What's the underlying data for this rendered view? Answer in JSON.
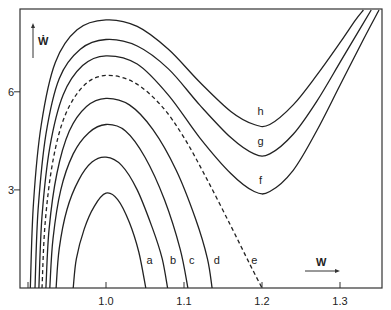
{
  "chart_data": {
    "type": "line",
    "title": "",
    "xlabel": "W",
    "ylabel": "Ẇ",
    "xlim": [
      0.885,
      1.355
    ],
    "ylim": [
      0,
      8.5
    ],
    "grid": false,
    "legend": "none (curves labeled inline a–h)",
    "x_ticks": [
      0.9,
      1.0,
      1.1,
      1.2,
      1.3
    ],
    "x_tick_labels": [
      "",
      "1.0",
      "1.1",
      "1.2",
      "1.3"
    ],
    "y_ticks": [
      3,
      6
    ],
    "y_tick_labels": [
      "3",
      "6"
    ],
    "series": [
      {
        "name": "a",
        "style": "solid",
        "label_pos": [
          1.056,
          0.85
        ],
        "points": [
          [
            0.958,
            0
          ],
          [
            0.962,
            0.9
          ],
          [
            0.972,
            1.8
          ],
          [
            0.985,
            2.5
          ],
          [
            1.0,
            2.9
          ],
          [
            1.015,
            2.7
          ],
          [
            1.03,
            2.0
          ],
          [
            1.042,
            1.1
          ],
          [
            1.051,
            0
          ]
        ]
      },
      {
        "name": "b",
        "style": "solid",
        "label_pos": [
          1.086,
          0.85
        ],
        "points": [
          [
            0.936,
            0
          ],
          [
            0.94,
            1.2
          ],
          [
            0.95,
            2.4
          ],
          [
            0.965,
            3.3
          ],
          [
            0.982,
            3.85
          ],
          [
            1.0,
            4.0
          ],
          [
            1.02,
            3.75
          ],
          [
            1.04,
            3.0
          ],
          [
            1.06,
            1.8
          ],
          [
            1.072,
            0.9
          ],
          [
            1.079,
            0
          ]
        ]
      },
      {
        "name": "c",
        "style": "solid",
        "label_pos": [
          1.11,
          0.85
        ],
        "points": [
          [
            0.928,
            0
          ],
          [
            0.932,
            1.5
          ],
          [
            0.942,
            3.0
          ],
          [
            0.958,
            4.1
          ],
          [
            0.978,
            4.75
          ],
          [
            1.0,
            5.0
          ],
          [
            1.025,
            4.8
          ],
          [
            1.05,
            4.0
          ],
          [
            1.075,
            2.7
          ],
          [
            1.095,
            1.2
          ],
          [
            1.105,
            0
          ]
        ]
      },
      {
        "name": "d",
        "style": "solid",
        "label_pos": [
          1.142,
          0.85
        ],
        "points": [
          [
            0.923,
            0
          ],
          [
            0.927,
            1.8
          ],
          [
            0.937,
            3.5
          ],
          [
            0.953,
            4.8
          ],
          [
            0.975,
            5.55
          ],
          [
            1.0,
            5.8
          ],
          [
            1.03,
            5.6
          ],
          [
            1.06,
            4.85
          ],
          [
            1.09,
            3.6
          ],
          [
            1.115,
            2.1
          ],
          [
            1.13,
            0.9
          ],
          [
            1.136,
            0
          ]
        ]
      },
      {
        "name": "e",
        "style": "dashed",
        "label_pos": [
          1.19,
          0.85
        ],
        "points": [
          [
            0.918,
            0
          ],
          [
            0.922,
            2.0
          ],
          [
            0.932,
            3.9
          ],
          [
            0.948,
            5.3
          ],
          [
            0.972,
            6.2
          ],
          [
            1.0,
            6.5
          ],
          [
            1.035,
            6.3
          ],
          [
            1.07,
            5.6
          ],
          [
            1.1,
            4.6
          ],
          [
            1.13,
            3.3
          ],
          [
            1.16,
            1.9
          ],
          [
            1.185,
            0.7
          ],
          [
            1.2,
            0
          ]
        ]
      },
      {
        "name": "f",
        "style": "solid",
        "label_pos": [
          1.198,
          3.3
        ],
        "points": [
          [
            0.914,
            0
          ],
          [
            0.918,
            2.2
          ],
          [
            0.928,
            4.3
          ],
          [
            0.945,
            5.9
          ],
          [
            0.97,
            6.8
          ],
          [
            1.0,
            7.1
          ],
          [
            1.04,
            6.85
          ],
          [
            1.08,
            5.9
          ],
          [
            1.12,
            4.6
          ],
          [
            1.16,
            3.5
          ],
          [
            1.19,
            2.95
          ],
          [
            1.21,
            2.95
          ],
          [
            1.24,
            3.6
          ],
          [
            1.27,
            4.8
          ],
          [
            1.3,
            6.2
          ],
          [
            1.33,
            7.6
          ],
          [
            1.35,
            8.5
          ]
        ]
      },
      {
        "name": "g",
        "style": "solid",
        "label_pos": [
          1.198,
          4.5
        ],
        "points": [
          [
            0.909,
            0
          ],
          [
            0.913,
            2.4
          ],
          [
            0.923,
            4.7
          ],
          [
            0.94,
            6.4
          ],
          [
            0.967,
            7.3
          ],
          [
            1.0,
            7.6
          ],
          [
            1.04,
            7.4
          ],
          [
            1.08,
            6.7
          ],
          [
            1.12,
            5.6
          ],
          [
            1.16,
            4.6
          ],
          [
            1.19,
            4.1
          ],
          [
            1.21,
            4.1
          ],
          [
            1.24,
            4.7
          ],
          [
            1.27,
            5.7
          ],
          [
            1.3,
            6.9
          ],
          [
            1.325,
            7.9
          ],
          [
            1.34,
            8.5
          ]
        ]
      },
      {
        "name": "h",
        "style": "solid",
        "label_pos": [
          1.198,
          5.4
        ],
        "points": [
          [
            0.903,
            0
          ],
          [
            0.907,
            2.6
          ],
          [
            0.917,
            5.0
          ],
          [
            0.935,
            6.9
          ],
          [
            0.963,
            7.9
          ],
          [
            1.0,
            8.2
          ],
          [
            1.04,
            8.0
          ],
          [
            1.08,
            7.3
          ],
          [
            1.12,
            6.3
          ],
          [
            1.16,
            5.4
          ],
          [
            1.19,
            5.0
          ],
          [
            1.21,
            5.0
          ],
          [
            1.24,
            5.6
          ],
          [
            1.27,
            6.5
          ],
          [
            1.3,
            7.5
          ],
          [
            1.32,
            8.2
          ],
          [
            1.33,
            8.5
          ]
        ]
      }
    ]
  }
}
